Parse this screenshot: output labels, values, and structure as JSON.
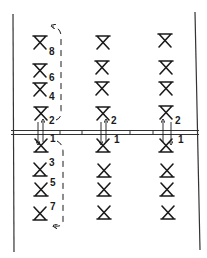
{
  "diagram": {
    "type": "hand-drawn layout diagram",
    "colors": {
      "ink": "#1a1a1a",
      "background": "#ffffff"
    },
    "columns": [
      {
        "id": "left",
        "upper_labels": [
          "8",
          "6",
          "4",
          "2"
        ],
        "lower_labels": [
          "1",
          "3",
          "5",
          "7"
        ],
        "has_loop_upper": true,
        "has_loop_lower": true
      },
      {
        "id": "middle",
        "upper_labels": [
          "",
          "",
          "",
          "2"
        ],
        "lower_labels": [
          "1",
          "",
          "",
          ""
        ],
        "has_loop_upper": false,
        "has_loop_lower": false
      },
      {
        "id": "right",
        "upper_labels": [
          "",
          "",
          "",
          "2"
        ],
        "lower_labels": [
          "1",
          "",
          "",
          ""
        ],
        "has_loop_upper": false,
        "has_loop_lower": false
      }
    ],
    "symbol_upper": "down-pointing hourglass (bar on top)",
    "symbol_lower": "up-pointing hourglass (bar on bottom)",
    "crossing_arrows": "paired up/down arrows crossing the rail between symbols 2 and 1 in each column"
  }
}
